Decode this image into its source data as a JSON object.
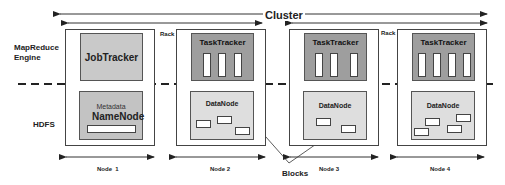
{
  "title": "Cluster",
  "layers": {
    "mapreduce": "MapReduce\nEngine",
    "mapreduce_line1": "MapReduce",
    "mapreduce_line2": "Engine",
    "hdfs": "HDFS"
  },
  "rack_label": "Rack",
  "nodes": [
    {
      "label": "Node  1",
      "top": "JobTracker",
      "bottom_caption": "Metadata",
      "bottom": "NameNode"
    },
    {
      "label": "Node 2",
      "top": "TaskTracker",
      "bottom": "DataNode",
      "slots": 3,
      "blocks": 3
    },
    {
      "label": "Node 3",
      "top": "TaskTracker",
      "bottom": "DataNode",
      "slots": 3,
      "blocks": 2
    },
    {
      "label": "Node 4",
      "top": "TaskTracker",
      "bottom": "DataNode",
      "slots": 4,
      "blocks": 4
    }
  ],
  "callout": "Blocks",
  "colors": {
    "jobtracker": "#c9c9c9",
    "tasktracker": "#9e9e9e",
    "datanode": "#dedede",
    "namenode": "#c3c3c3"
  }
}
